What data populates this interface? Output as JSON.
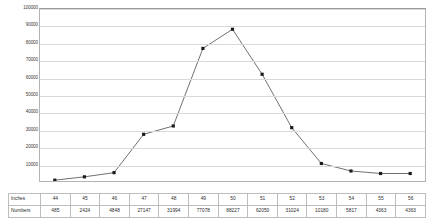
{
  "chart_data": {
    "type": "line",
    "title": "",
    "xlabel": "",
    "ylabel": "",
    "x": [
      44,
      45,
      46,
      47,
      48,
      49,
      50,
      51,
      52,
      53,
      54,
      55,
      56
    ],
    "categories": [
      "44",
      "45",
      "46",
      "47",
      "48",
      "49",
      "50",
      "51",
      "52",
      "53",
      "54",
      "55",
      "56"
    ],
    "values": [
      485,
      2424,
      4848,
      27147,
      31994,
      77078,
      88227,
      62050,
      31024,
      10180,
      5817,
      4363,
      4363
    ],
    "series": [
      {
        "name": "Numbers",
        "values": [
          485,
          2424,
          4848,
          27147,
          31994,
          77078,
          88227,
          62050,
          31024,
          10180,
          5817,
          4363,
          4363
        ]
      }
    ],
    "ylim": [
      0,
      100000
    ],
    "y_ticks": [
      10000,
      20000,
      30000,
      40000,
      50000,
      60000,
      70000,
      80000,
      90000,
      100000
    ],
    "y_tick_labels": [
      "10000",
      "20000",
      "30000",
      "40000",
      "50000",
      "60000",
      "70000",
      "80000",
      "90000",
      "100000"
    ],
    "grid": true,
    "legend": false,
    "marker": "square",
    "line_color": "#4a4a4a",
    "marker_color": "#1a1a1a",
    "grid_color": "#d9d9d9"
  },
  "table": {
    "row_headers": [
      "Inches",
      "Numbers"
    ],
    "rows": [
      [
        "44",
        "45",
        "46",
        "47",
        "48",
        "49",
        "50",
        "51",
        "52",
        "53",
        "54",
        "55",
        "56"
      ],
      [
        "485",
        "2424",
        "4848",
        "27147",
        "31994",
        "77078",
        "88227",
        "62050",
        "31024",
        "10180",
        "5817",
        "4363",
        "4363"
      ]
    ]
  }
}
